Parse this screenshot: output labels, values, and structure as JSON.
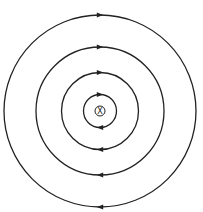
{
  "diagram": {
    "title": "",
    "center": {
      "x": 100,
      "y": 111
    },
    "wire": {
      "symbol": "X",
      "meaning": "current-into-page",
      "radius": 5
    },
    "field_lines": [
      {
        "radius": 16.5,
        "direction": "clockwise"
      },
      {
        "radius": 38.5,
        "direction": "clockwise"
      },
      {
        "radius": 64,
        "direction": "clockwise"
      },
      {
        "radius": 96,
        "direction": "clockwise"
      }
    ],
    "colors": {
      "stroke": "#222222",
      "background": "#ffffff"
    }
  }
}
